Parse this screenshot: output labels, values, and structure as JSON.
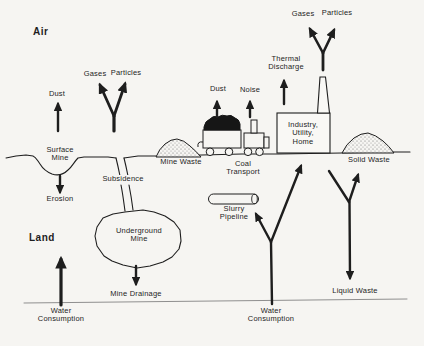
{
  "colors": {
    "ink": "#1e1e1e",
    "paper": "#f6f5f2",
    "water_line": "#8f8f8f"
  },
  "labels": {
    "air": "Air",
    "land": "Land",
    "gases_mine": "Gases",
    "particles_mine": "Particles",
    "dust_mine": "Dust",
    "surface_mine": "Surface\nMine",
    "subsidence": "Subsidence",
    "erosion": "Erosion",
    "underground_mine": "Underground\nMine",
    "mine_drainage": "Mine Drainage",
    "water_consumption_mine": "Water\nConsumption",
    "mine_waste": "Mine Waste",
    "dust_transport": "Dust",
    "noise_transport": "Noise",
    "coal_transport": "Coal\nTransport",
    "slurry_pipeline": "Slurry\nPipeline",
    "water_consumption_plant": "Water\nConsumption",
    "thermal_discharge": "Thermal\nDischarge",
    "industry_utility_home": "Industry,\nUtility,\nHome",
    "gases_plant": "Gases",
    "particles_plant": "Particles",
    "solid_waste": "Solid Waste",
    "liquid_waste": "Liquid Waste"
  }
}
